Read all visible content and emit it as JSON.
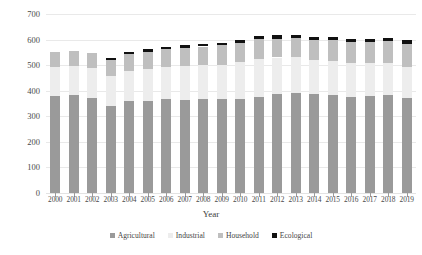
{
  "chart_data": {
    "type": "bar",
    "stacked": true,
    "title": "",
    "xlabel": "Year",
    "ylabel": "Billion m3",
    "ylim": [
      0,
      700
    ],
    "ytick_step": 100,
    "yticks": [
      0,
      100,
      200,
      300,
      400,
      500,
      600,
      700
    ],
    "grid": true,
    "legend_position": "bottom",
    "categories": [
      "2000",
      "2001",
      "2002",
      "2003",
      "2004",
      "2005",
      "2006",
      "2007",
      "2008",
      "2009",
      "2010",
      "2011",
      "2012",
      "2013",
      "2014",
      "2015",
      "2016",
      "2017",
      "2018",
      "2019"
    ],
    "series": [
      {
        "name": "Agricultural",
        "color": "#9a9a9a",
        "values": [
          378,
          382,
          373,
          342,
          359,
          358,
          366,
          362,
          366,
          368,
          369,
          377,
          388,
          392,
          386,
          385,
          376,
          380,
          383,
          372
        ]
      },
      {
        "name": "Industrial",
        "color": "#ededed",
        "values": [
          114,
          114,
          114,
          117,
          119,
          127,
          128,
          134,
          134,
          134,
          142,
          146,
          142,
          141,
          136,
          133,
          133,
          127,
          126,
          122
        ]
      },
      {
        "name": "Household",
        "color": "#bfbfbf",
        "values": [
          58,
          60,
          62,
          63,
          65,
          68,
          69,
          71,
          73,
          75,
          77,
          79,
          74,
          75,
          77,
          80,
          82,
          84,
          86,
          88
        ]
      },
      {
        "name": "Ecological",
        "color": "#111111",
        "values": [
          0,
          0,
          0,
          8,
          9,
          9,
          10,
          10,
          10,
          11,
          12,
          12,
          14,
          11,
          11,
          11,
          10,
          12,
          13,
          16
        ]
      }
    ],
    "totals": [
      550,
      556,
      549,
      530,
      552,
      562,
      573,
      577,
      583,
      588,
      600,
      614,
      618,
      619,
      610,
      609,
      601,
      603,
      608,
      598
    ]
  },
  "axes": {
    "y_title": "Billion m3",
    "x_title": "Year",
    "y_tick_labels": [
      "700",
      "600",
      "500",
      "400",
      "300",
      "200",
      "100",
      "0"
    ]
  },
  "legend": {
    "items": [
      {
        "label": "Agricultural",
        "color": "#9a9a9a"
      },
      {
        "label": "Industrial",
        "color": "#ededed"
      },
      {
        "label": "Household",
        "color": "#bfbfbf"
      },
      {
        "label": "Ecological",
        "color": "#111111"
      }
    ]
  }
}
